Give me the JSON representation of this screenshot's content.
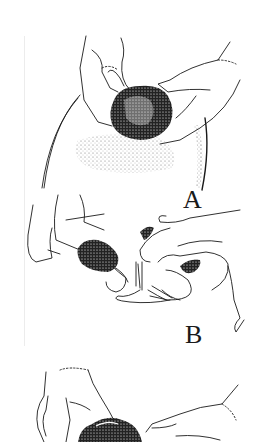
{
  "figure": {
    "type": "line-art illustration",
    "panels": [
      {
        "id": "A",
        "label": "A",
        "description": "Two hands grasping a dark tuft of hair on a stippled curved scalp"
      },
      {
        "id": "B",
        "label": "B",
        "description": "Hands separating/twisting strands of hair between fingers"
      },
      {
        "id": "C",
        "label": "",
        "description": "Partially visible hands holding a dark curly hair tuft (cropped at bottom)"
      }
    ],
    "colors": {
      "ink": "#1a1a1a",
      "paper": "#ffffff",
      "stipple": "#555555"
    }
  }
}
